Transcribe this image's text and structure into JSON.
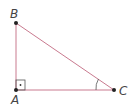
{
  "diagram": {
    "type": "right-triangle",
    "line_color": "#c97a8f",
    "vertices": [
      {
        "label": "B",
        "x": 16,
        "y": 23
      },
      {
        "label": "A",
        "x": 16,
        "y": 90
      },
      {
        "label": "C",
        "x": 114,
        "y": 90
      }
    ],
    "right_angle_at": "A",
    "marked_angle_at": "C",
    "labels": {
      "a": "A",
      "b": "B",
      "c": "C"
    }
  }
}
